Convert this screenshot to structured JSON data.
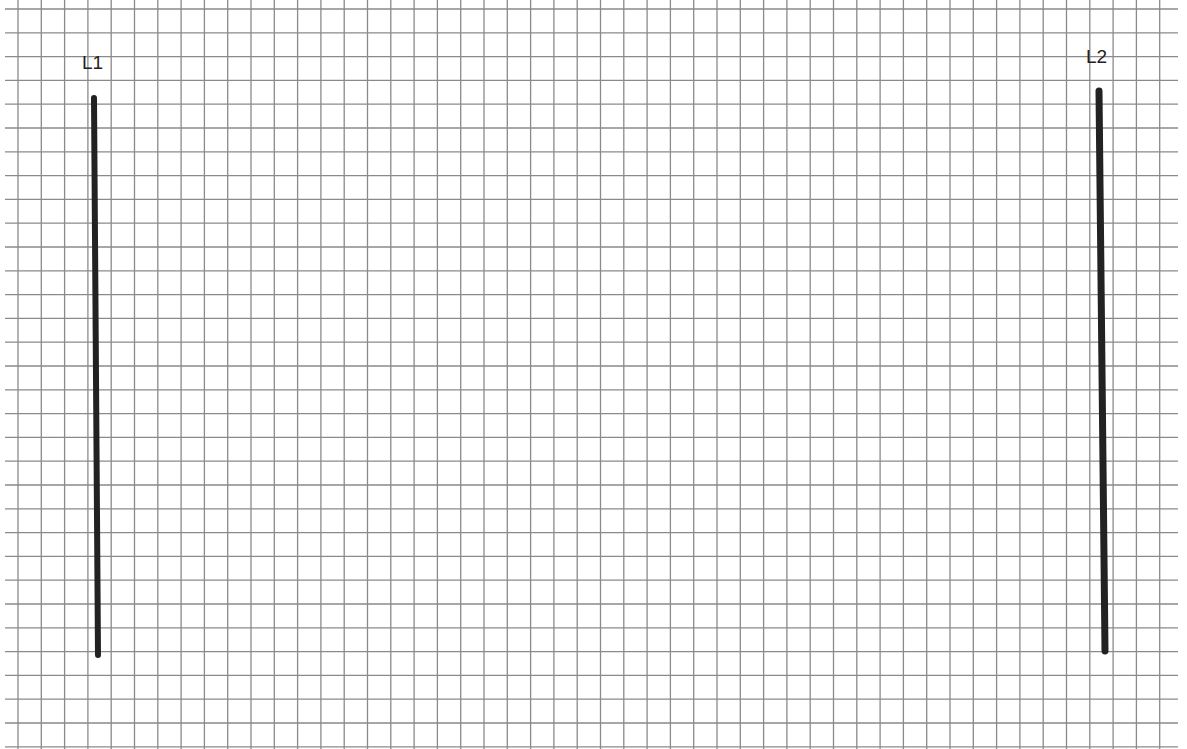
{
  "diagram": {
    "type": "grid-paper-with-lines",
    "background": "#ffffff",
    "grid": {
      "color": "#8a8a8a",
      "x_start": 18,
      "x_spacing": 23.3,
      "x_count": 50,
      "y_start": 9,
      "y_spacing": 23.8,
      "y_count": 32,
      "h_line_x_from": 5,
      "h_line_x_to": 1178,
      "v_line_y_from": 0,
      "v_line_y_to": 749
    },
    "lines": [
      {
        "id": "L1",
        "label": "L1",
        "label_x": 82,
        "label_y": 53,
        "x1": 94,
        "y1": 98,
        "x2": 98,
        "y2": 655,
        "color": "#222222",
        "width": 6
      },
      {
        "id": "L2",
        "label": "L2",
        "label_x": 1086,
        "label_y": 47,
        "x1": 1099,
        "y1": 91,
        "x2": 1105,
        "y2": 651,
        "color": "#222222",
        "width": 7
      }
    ]
  }
}
